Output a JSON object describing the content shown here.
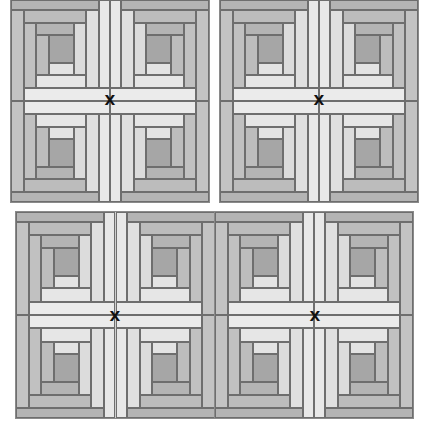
{
  "diagram": {
    "title": "",
    "center_mark_glyph": "X",
    "colors": {
      "background": "#ffffff",
      "seam": "#6e6e6e",
      "shade_darkest": "#a6a6a6",
      "shade_dark": "#b4b4b4",
      "shade_mid_dark": "#bcbcbc",
      "shade_mid": "#c2c2c2",
      "shade_light": "#dedede",
      "shade_lighter": "#e6e6e6",
      "shade_lightest": "#ececec"
    },
    "block_template": {
      "width": 99,
      "height": 101,
      "logs": [
        {
          "name": "center-square",
          "x": 38,
          "y": 35,
          "w": 25,
          "h": 28,
          "color": "#a6a6a6"
        },
        {
          "name": "ring3-top",
          "x": 25,
          "y": 23,
          "w": 38,
          "h": 12,
          "color": "#b4b4b4"
        },
        {
          "name": "ring3-left",
          "x": 25,
          "y": 35,
          "w": 13,
          "h": 40,
          "color": "#bdbdbd"
        },
        {
          "name": "ring3-bottom",
          "x": 38,
          "y": 63,
          "w": 25,
          "h": 12,
          "color": "#e3e3e3"
        },
        {
          "name": "ring3-right",
          "x": 63,
          "y": 23,
          "w": 12,
          "h": 52,
          "color": "#dcdcdc"
        },
        {
          "name": "ring2-top",
          "x": 13,
          "y": 10,
          "w": 62,
          "h": 13,
          "color": "#bcbcbc"
        },
        {
          "name": "ring2-left",
          "x": 13,
          "y": 23,
          "w": 12,
          "h": 65,
          "color": "#c1c1c1"
        },
        {
          "name": "ring2-bottom",
          "x": 25,
          "y": 75,
          "w": 50,
          "h": 13,
          "color": "#e6e6e6"
        },
        {
          "name": "ring2-right",
          "x": 75,
          "y": 10,
          "w": 13,
          "h": 78,
          "color": "#e0e0e0"
        },
        {
          "name": "ring1-top",
          "x": 0,
          "y": 0,
          "w": 88,
          "h": 10,
          "color": "#b4b4b4"
        },
        {
          "name": "ring1-left",
          "x": 0,
          "y": 10,
          "w": 13,
          "h": 91,
          "color": "#c3c3c3"
        },
        {
          "name": "ring1-bottom",
          "x": 13,
          "y": 88,
          "w": 86,
          "h": 13,
          "color": "#ebebeb"
        },
        {
          "name": "ring1-right",
          "x": 88,
          "y": 0,
          "w": 11,
          "h": 88,
          "color": "#e8e8e8"
        }
      ]
    },
    "quilts": [
      {
        "name": "quilt-top-left",
        "x": 11,
        "y": 0,
        "w": 198,
        "h": 202,
        "mark": {
          "x": 110,
          "y": 100
        }
      },
      {
        "name": "quilt-top-right",
        "x": 220,
        "y": 0,
        "w": 198,
        "h": 202,
        "mark": {
          "x": 319,
          "y": 100
        }
      },
      {
        "name": "quilt-bottom-left-half",
        "x": 16,
        "y": 212,
        "w": 199,
        "h": 206,
        "mark": {
          "x": 115,
          "y": 316
        }
      },
      {
        "name": "quilt-bottom-right-half",
        "x": 215,
        "y": 212,
        "w": 198,
        "h": 206,
        "mark": {
          "x": 315,
          "y": 316
        }
      }
    ],
    "block_positions": [
      {
        "name": "block-top-left",
        "col": 0,
        "row": 0,
        "flipX": false,
        "flipY": false
      },
      {
        "name": "block-top-right",
        "col": 1,
        "row": 0,
        "flipX": true,
        "flipY": false
      },
      {
        "name": "block-bottom-left",
        "col": 0,
        "row": 1,
        "flipX": false,
        "flipY": true
      },
      {
        "name": "block-bottom-right",
        "col": 1,
        "row": 1,
        "flipX": true,
        "flipY": true
      }
    ]
  }
}
